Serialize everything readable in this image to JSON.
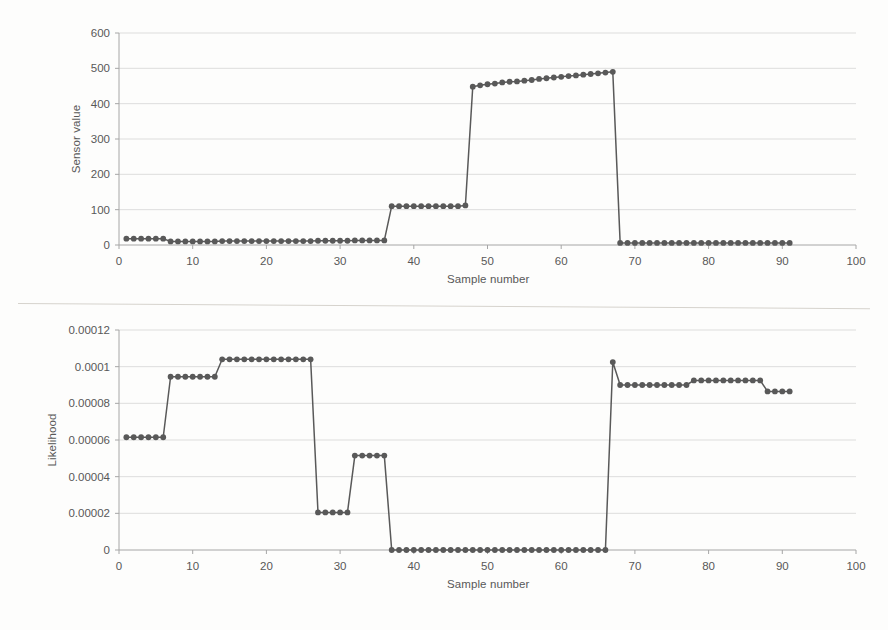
{
  "figure": {
    "background_color": "#fdfdfc",
    "series_color": "#595959",
    "grid_color": "#d9d9d9",
    "axis_color": "#a6a6a6",
    "text_color": "#585858"
  },
  "chart_data": [
    {
      "type": "line",
      "id": "sensor-value-chart",
      "title": "",
      "xlabel": "Sample number",
      "ylabel": "Sensor value",
      "xlim": [
        0,
        100
      ],
      "ylim": [
        0,
        600
      ],
      "xticks": [
        0,
        10,
        20,
        30,
        40,
        50,
        60,
        70,
        80,
        90,
        100
      ],
      "yticks": [
        0,
        100,
        200,
        300,
        400,
        500,
        600
      ],
      "grid": true,
      "legend": "none",
      "markers": true,
      "x": [
        1,
        2,
        3,
        4,
        5,
        6,
        7,
        8,
        9,
        10,
        11,
        12,
        13,
        14,
        15,
        16,
        17,
        18,
        19,
        20,
        21,
        22,
        23,
        24,
        25,
        26,
        27,
        28,
        29,
        30,
        31,
        32,
        33,
        34,
        35,
        36,
        37,
        38,
        39,
        40,
        41,
        42,
        43,
        44,
        45,
        46,
        47,
        48,
        49,
        50,
        51,
        52,
        53,
        54,
        55,
        56,
        57,
        58,
        59,
        60,
        61,
        62,
        63,
        64,
        65,
        66,
        67,
        68,
        69,
        70,
        71,
        72,
        73,
        74,
        75,
        76,
        77,
        78,
        79,
        80,
        81,
        82,
        83,
        84,
        85,
        86,
        87,
        88,
        89,
        90,
        91
      ],
      "values": [
        18,
        18,
        18,
        18,
        18,
        18,
        10,
        10,
        10,
        10,
        10,
        10,
        10,
        11,
        11,
        11,
        11,
        11,
        11,
        11,
        11,
        11,
        11,
        11,
        11,
        11,
        12,
        12,
        12,
        12,
        12,
        13,
        13,
        13,
        13,
        13,
        110,
        110,
        110,
        110,
        110,
        110,
        110,
        110,
        110,
        110,
        112,
        448,
        452,
        455,
        457,
        460,
        462,
        463,
        465,
        467,
        470,
        472,
        474,
        476,
        478,
        480,
        482,
        484,
        486,
        488,
        490,
        6,
        6,
        6,
        6,
        6,
        6,
        6,
        6,
        6,
        6,
        6,
        6,
        6,
        6,
        6,
        6,
        6,
        6,
        6,
        6,
        6,
        6,
        6,
        6
      ]
    },
    {
      "type": "line",
      "id": "likelihood-chart",
      "title": "",
      "xlabel": "Sample number",
      "ylabel": "Likelihood",
      "xlim": [
        0,
        100
      ],
      "ylim": [
        0,
        0.00012
      ],
      "xticks": [
        0,
        10,
        20,
        30,
        40,
        50,
        60,
        70,
        80,
        90,
        100
      ],
      "yticks": [
        0,
        2e-05,
        4e-05,
        6e-05,
        8e-05,
        0.0001,
        0.00012
      ],
      "ytick_labels": [
        "0",
        "0.00002",
        "0.00004",
        "0.00006",
        "0.00008",
        "0.0001",
        "0.00012"
      ],
      "grid": true,
      "legend": "none",
      "markers": true,
      "x": [
        1,
        2,
        3,
        4,
        5,
        6,
        7,
        8,
        9,
        10,
        11,
        12,
        13,
        14,
        15,
        16,
        17,
        18,
        19,
        20,
        21,
        22,
        23,
        24,
        25,
        26,
        27,
        28,
        29,
        30,
        31,
        32,
        33,
        34,
        35,
        36,
        37,
        38,
        39,
        40,
        41,
        42,
        43,
        44,
        45,
        46,
        47,
        48,
        49,
        50,
        51,
        52,
        53,
        54,
        55,
        56,
        57,
        58,
        59,
        60,
        61,
        62,
        63,
        64,
        65,
        66,
        67,
        68,
        69,
        70,
        71,
        72,
        73,
        74,
        75,
        76,
        77,
        78,
        79,
        80,
        81,
        82,
        83,
        84,
        85,
        86,
        87,
        88,
        89,
        90,
        91
      ],
      "values": [
        6.15e-05,
        6.15e-05,
        6.15e-05,
        6.15e-05,
        6.15e-05,
        6.15e-05,
        9.45e-05,
        9.45e-05,
        9.45e-05,
        9.45e-05,
        9.45e-05,
        9.45e-05,
        9.45e-05,
        0.000104,
        0.000104,
        0.000104,
        0.000104,
        0.000104,
        0.000104,
        0.000104,
        0.000104,
        0.000104,
        0.000104,
        0.000104,
        0.000104,
        0.000104,
        2.05e-05,
        2.05e-05,
        2.05e-05,
        2.05e-05,
        2.05e-05,
        5.15e-05,
        5.15e-05,
        5.15e-05,
        5.15e-05,
        5.15e-05,
        0,
        0,
        0,
        0,
        0,
        0,
        0,
        0,
        0,
        0,
        0,
        0,
        0,
        0,
        0,
        0,
        0,
        0,
        0,
        0,
        0,
        0,
        0,
        0,
        0,
        0,
        0,
        0,
        0,
        0,
        0.0001025,
        9e-05,
        9e-05,
        9e-05,
        9e-05,
        9e-05,
        9e-05,
        9e-05,
        9e-05,
        9e-05,
        9e-05,
        9.25e-05,
        9.25e-05,
        9.25e-05,
        9.25e-05,
        9.25e-05,
        9.25e-05,
        9.25e-05,
        9.25e-05,
        9.25e-05,
        9.25e-05,
        8.65e-05,
        8.65e-05,
        8.65e-05,
        8.65e-05,
        8.65e-05
      ]
    }
  ]
}
